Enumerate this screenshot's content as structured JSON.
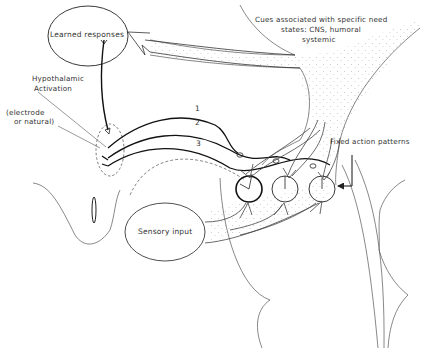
{
  "labels": {
    "learned_responses": "Learned responses",
    "hypothalamic_line1": "Hypothalamic",
    "hypothalamic_line2": "Activation",
    "electrode_line1": "(electrode",
    "electrode_line2": "or natural)",
    "cues_line1": "Cues associated with specific need",
    "cues_line2": "states: CNS, humoral",
    "cues_line3": "systemic",
    "fixed_action": "Fixed action patterns",
    "sensory_input": "Sensory input"
  },
  "pathways": [
    {
      "number": "1"
    },
    {
      "number": "2"
    },
    {
      "number": "3"
    }
  ],
  "nodes": [
    {
      "id": "circle-1",
      "emphasis": "bold"
    },
    {
      "id": "circle-2",
      "emphasis": "normal"
    },
    {
      "id": "circle-3",
      "emphasis": "normal"
    }
  ],
  "colors": {
    "ink": "#222222",
    "light_ink": "#555555",
    "stipple": "#9a9a9a",
    "background": "#ffffff"
  }
}
